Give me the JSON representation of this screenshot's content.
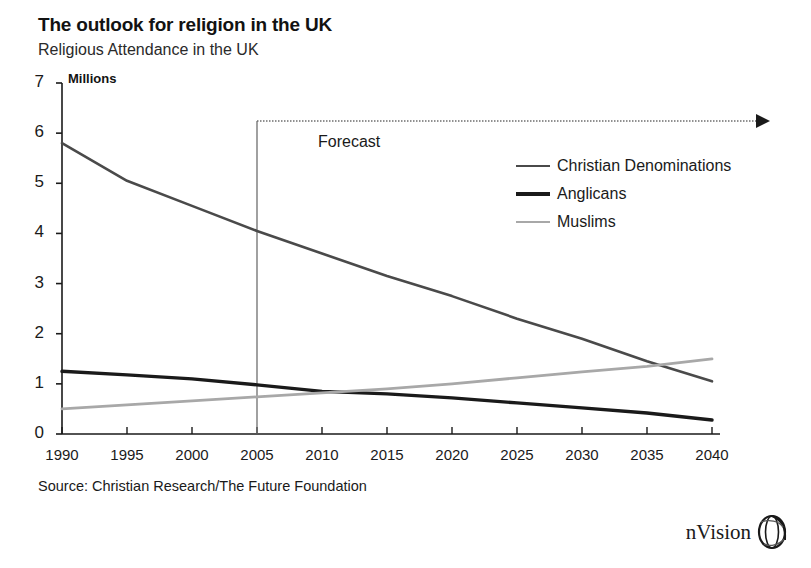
{
  "header": {
    "title": "The outlook for religion in the UK",
    "subtitle": "Religious Attendance in the UK",
    "unit_label": "Millions"
  },
  "footer": {
    "source": "Source: Christian Research/The Future Foundation",
    "brand": "nVision",
    "brand_icon": "globe-logo-icon"
  },
  "annotations": {
    "forecast_label": "Forecast",
    "forecast_start_year": 2005,
    "forecast_arrow_icon": "right-arrow-icon"
  },
  "colors": {
    "christian": "#4a4a4a",
    "anglicans": "#1a1a1a",
    "muslims": "#a8a8a8",
    "axis": "#1a1a1a",
    "forecast_divider": "#6e6e6e",
    "background": "#ffffff"
  },
  "chart_data": {
    "type": "line",
    "title": "The outlook for religion in the UK",
    "subtitle": "Religious Attendance in the UK",
    "xlabel": "",
    "ylabel": "Millions",
    "xlim": [
      1990,
      2040
    ],
    "ylim": [
      0,
      7
    ],
    "yticks": [
      0,
      1,
      2,
      3,
      4,
      5,
      6,
      7
    ],
    "ytick_labels": [
      "0",
      "1",
      "2",
      "3",
      "4",
      "5",
      "6",
      "7"
    ],
    "x": [
      1990,
      1995,
      2000,
      2005,
      2010,
      2015,
      2020,
      2025,
      2030,
      2035,
      2040
    ],
    "xtick_labels": [
      "1990",
      "1995",
      "2000",
      "2005",
      "2010",
      "2015",
      "2020",
      "2025",
      "2030",
      "2035",
      "2040"
    ],
    "grid": false,
    "legend_position": "upper right",
    "series": [
      {
        "name": "Christian Denominations",
        "color": "#4a4a4a",
        "width": 2.6,
        "values": [
          5.8,
          5.05,
          4.55,
          4.05,
          3.6,
          3.15,
          2.75,
          2.3,
          1.9,
          1.45,
          1.05
        ]
      },
      {
        "name": "Anglicans",
        "color": "#1a1a1a",
        "width": 3.4,
        "values": [
          1.25,
          1.18,
          1.1,
          0.98,
          0.85,
          0.8,
          0.72,
          0.62,
          0.52,
          0.42,
          0.28
        ]
      },
      {
        "name": "Muslims",
        "color": "#a8a8a8",
        "width": 2.8,
        "values": [
          0.5,
          0.58,
          0.66,
          0.74,
          0.82,
          0.9,
          1.0,
          1.12,
          1.24,
          1.35,
          1.5
        ]
      }
    ],
    "annotations": [
      {
        "text": "Forecast",
        "x": 2005,
        "note": "vertical divider separating history from forecast"
      }
    ]
  }
}
